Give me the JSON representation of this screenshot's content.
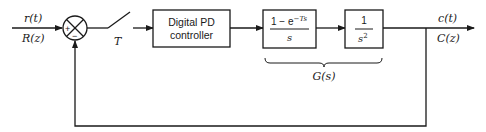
{
  "diagram": {
    "type": "digital control system block diagram",
    "input": {
      "time_label": "r(t)",
      "z_label": "R(z)"
    },
    "summing_junction": {
      "plus_sign": "+",
      "minus_sign": "−"
    },
    "sampler": {
      "label": "T"
    },
    "blocks": [
      {
        "id": "pd",
        "line1": "Digital PD",
        "line2": "controller"
      },
      {
        "id": "zoh",
        "numerator": "1 − e",
        "numerator_exp": "−Ts",
        "denominator": "s"
      },
      {
        "id": "plant",
        "numerator": "1",
        "denominator": "s",
        "denominator_exp": "2"
      }
    ],
    "grouping": {
      "label": "G(s)"
    },
    "output": {
      "time_label": "c(t)",
      "z_label": "C(z)"
    },
    "colors": {
      "stroke": "#1a1a1a",
      "background": "#ffffff"
    }
  }
}
